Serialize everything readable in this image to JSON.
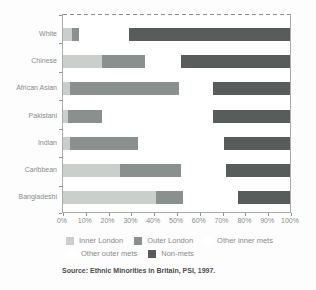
{
  "chart_data": {
    "type": "bar",
    "orientation": "horizontal",
    "stacked": true,
    "title": "",
    "xlabel": "",
    "ylabel": "",
    "xlim": [
      0,
      100
    ],
    "grid": false,
    "legend_position": "bottom",
    "categories": [
      "White",
      "Chinese",
      "African Asian",
      "Pakistani",
      "Indian",
      "Caribbean",
      "Bangladeshi"
    ],
    "series": [
      {
        "name": "Inner London",
        "color": "#cbcfcc",
        "values": [
          4,
          17,
          3,
          2,
          3,
          25,
          41
        ]
      },
      {
        "name": "Outer London",
        "color": "#8a908e",
        "values": [
          3,
          19,
          48,
          15,
          30,
          27,
          12
        ]
      },
      {
        "name": "Other inner mets",
        "color": "#ffffff",
        "values": [
          11,
          8,
          7,
          25,
          19,
          10,
          12
        ]
      },
      {
        "name": "Other outer mets",
        "color": "#ffffff",
        "values": [
          11,
          8,
          8,
          24,
          19,
          10,
          12
        ]
      },
      {
        "name": "Non-mets",
        "color": "#585d5c",
        "values": [
          71,
          48,
          34,
          34,
          29,
          28,
          23
        ]
      }
    ],
    "x_ticks": [
      "0%",
      "10%",
      "20%",
      "30%",
      "40%",
      "50%",
      "60%",
      "70%",
      "80%",
      "90%",
      "100%"
    ],
    "source": "Source: Ethnic Minorities in Britain, PSI, 1997."
  }
}
